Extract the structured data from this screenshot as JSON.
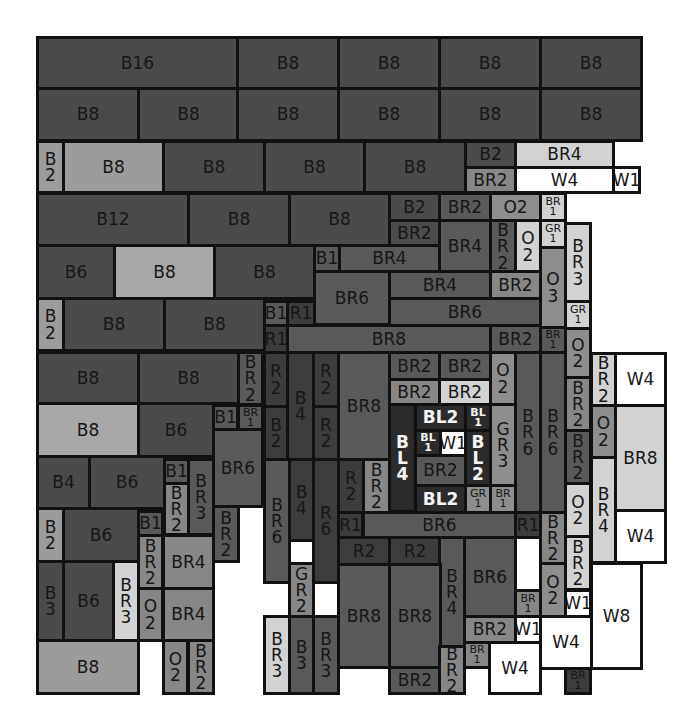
{
  "palette": {
    "B": "#4b4b4b",
    "Blight": "#9c9c9c",
    "Bpale": "#a8a8a8",
    "BR": "#5a5a5a",
    "BRmid": "#878787",
    "BRlight": "#bdbdbd",
    "BRpale": "#d2d2d2",
    "R": "#3c3c3c",
    "O": "#8e8e8e",
    "GR": "#a3a3a3",
    "W": "#ffffff",
    "BL": "#2b2b2b"
  },
  "blocks": [
    {
      "label": "B16",
      "x": 36,
      "y": 36,
      "w": 203,
      "h": 54,
      "c": "B"
    },
    {
      "label": "B8",
      "x": 236,
      "y": 36,
      "w": 104,
      "h": 54,
      "c": "B"
    },
    {
      "label": "B8",
      "x": 337,
      "y": 36,
      "w": 104,
      "h": 54,
      "c": "B"
    },
    {
      "label": "B8",
      "x": 438,
      "y": 36,
      "w": 104,
      "h": 54,
      "c": "B"
    },
    {
      "label": "B8",
      "x": 539,
      "y": 36,
      "w": 104,
      "h": 54,
      "c": "B"
    },
    {
      "label": "B8",
      "x": 36,
      "y": 87,
      "w": 104,
      "h": 55,
      "c": "B"
    },
    {
      "label": "B8",
      "x": 137,
      "y": 87,
      "w": 103,
      "h": 55,
      "c": "B"
    },
    {
      "label": "B8",
      "x": 236,
      "y": 87,
      "w": 104,
      "h": 55,
      "c": "B"
    },
    {
      "label": "B8",
      "x": 337,
      "y": 87,
      "w": 104,
      "h": 55,
      "c": "B"
    },
    {
      "label": "B8",
      "x": 438,
      "y": 87,
      "w": 104,
      "h": 55,
      "c": "B"
    },
    {
      "label": "B8",
      "x": 539,
      "y": 87,
      "w": 104,
      "h": 55,
      "c": "B"
    },
    {
      "label": "B\n2",
      "x": 36,
      "y": 140,
      "w": 29,
      "h": 54,
      "c": "Blight",
      "v": true
    },
    {
      "label": "B8",
      "x": 62,
      "y": 140,
      "w": 103,
      "h": 54,
      "c": "Blight"
    },
    {
      "label": "B8",
      "x": 162,
      "y": 140,
      "w": 104,
      "h": 54,
      "c": "B"
    },
    {
      "label": "B8",
      "x": 263,
      "y": 140,
      "w": 103,
      "h": 54,
      "c": "B"
    },
    {
      "label": "B8",
      "x": 363,
      "y": 140,
      "w": 104,
      "h": 54,
      "c": "B"
    },
    {
      "label": "B2",
      "x": 464,
      "y": 140,
      "w": 53,
      "h": 29,
      "c": "B"
    },
    {
      "label": "BR4",
      "x": 514,
      "y": 140,
      "w": 101,
      "h": 29,
      "c": "BRpale"
    },
    {
      "label": "BR2",
      "x": 464,
      "y": 166,
      "w": 53,
      "h": 28,
      "c": "BRmid"
    },
    {
      "label": "W4",
      "x": 514,
      "y": 166,
      "w": 101,
      "h": 28,
      "c": "W"
    },
    {
      "label": "W1",
      "x": 612,
      "y": 166,
      "w": 29,
      "h": 28,
      "c": "W"
    },
    {
      "label": "B12",
      "x": 36,
      "y": 192,
      "w": 154,
      "h": 55,
      "c": "B"
    },
    {
      "label": "B8",
      "x": 187,
      "y": 192,
      "w": 104,
      "h": 55,
      "c": "B"
    },
    {
      "label": "B8",
      "x": 288,
      "y": 192,
      "w": 103,
      "h": 55,
      "c": "B"
    },
    {
      "label": "B2",
      "x": 388,
      "y": 192,
      "w": 53,
      "h": 30,
      "c": "B"
    },
    {
      "label": "BR2",
      "x": 438,
      "y": 192,
      "w": 54,
      "h": 30,
      "c": "BR"
    },
    {
      "label": "O2",
      "x": 489,
      "y": 192,
      "w": 53,
      "h": 30,
      "c": "O"
    },
    {
      "label": "BR\n1",
      "x": 539,
      "y": 192,
      "w": 28,
      "h": 30,
      "c": "BRpale",
      "s": true
    },
    {
      "label": "BR2",
      "x": 388,
      "y": 219,
      "w": 53,
      "h": 28,
      "c": "B"
    },
    {
      "label": "BR4",
      "x": 438,
      "y": 219,
      "w": 54,
      "h": 55,
      "c": "BR"
    },
    {
      "label": "B\nR\n2",
      "x": 489,
      "y": 219,
      "w": 28,
      "h": 55,
      "c": "BR",
      "v": true
    },
    {
      "label": "O\n2",
      "x": 514,
      "y": 219,
      "w": 28,
      "h": 55,
      "c": "BRpale",
      "v": true
    },
    {
      "label": "GR\n1",
      "x": 539,
      "y": 219,
      "w": 28,
      "h": 30,
      "c": "BRpale",
      "s": true
    },
    {
      "label": "B\nR\n3",
      "x": 564,
      "y": 222,
      "w": 28,
      "h": 81,
      "c": "BRpale",
      "v": true
    },
    {
      "label": "B6",
      "x": 36,
      "y": 244,
      "w": 80,
      "h": 56,
      "c": "B"
    },
    {
      "label": "B8",
      "x": 113,
      "y": 244,
      "w": 103,
      "h": 56,
      "c": "Bpale"
    },
    {
      "label": "B8",
      "x": 213,
      "y": 244,
      "w": 103,
      "h": 56,
      "c": "B"
    },
    {
      "label": "B1",
      "x": 313,
      "y": 244,
      "w": 28,
      "h": 29,
      "c": "BR"
    },
    {
      "label": "BR4",
      "x": 338,
      "y": 244,
      "w": 103,
      "h": 29,
      "c": "BR"
    },
    {
      "label": "BR6",
      "x": 313,
      "y": 270,
      "w": 78,
      "h": 56,
      "c": "BR"
    },
    {
      "label": "BR4",
      "x": 388,
      "y": 270,
      "w": 104,
      "h": 30,
      "c": "BR"
    },
    {
      "label": "BR2",
      "x": 489,
      "y": 270,
      "w": 53,
      "h": 30,
      "c": "BRmid"
    },
    {
      "label": "O\n3",
      "x": 539,
      "y": 246,
      "w": 28,
      "h": 83,
      "c": "O",
      "v": true
    },
    {
      "label": "GR\n1",
      "x": 564,
      "y": 300,
      "w": 28,
      "h": 30,
      "c": "BRpale",
      "s": true
    },
    {
      "label": "B\n2",
      "x": 36,
      "y": 297,
      "w": 29,
      "h": 55,
      "c": "Blight",
      "v": true
    },
    {
      "label": "B8",
      "x": 62,
      "y": 297,
      "w": 104,
      "h": 55,
      "c": "B"
    },
    {
      "label": "B8",
      "x": 163,
      "y": 297,
      "w": 103,
      "h": 55,
      "c": "B"
    },
    {
      "label": "B1",
      "x": 263,
      "y": 300,
      "w": 26,
      "h": 27,
      "c": "BR"
    },
    {
      "label": "R1",
      "x": 286,
      "y": 300,
      "w": 30,
      "h": 27,
      "c": "R"
    },
    {
      "label": "BR6",
      "x": 388,
      "y": 297,
      "w": 154,
      "h": 30,
      "c": "BR"
    },
    {
      "label": "R1",
      "x": 263,
      "y": 324,
      "w": 26,
      "h": 30,
      "c": "R"
    },
    {
      "label": "BR8",
      "x": 286,
      "y": 324,
      "w": 206,
      "h": 30,
      "c": "BR"
    },
    {
      "label": "BR2",
      "x": 489,
      "y": 324,
      "w": 53,
      "h": 30,
      "c": "BR"
    },
    {
      "label": "BR\n1",
      "x": 539,
      "y": 326,
      "w": 28,
      "h": 28,
      "c": "BR",
      "s": true
    },
    {
      "label": "O\n2",
      "x": 564,
      "y": 327,
      "w": 28,
      "h": 52,
      "c": "O",
      "v": true
    },
    {
      "label": "B8",
      "x": 36,
      "y": 351,
      "w": 104,
      "h": 54,
      "c": "B"
    },
    {
      "label": "B8",
      "x": 137,
      "y": 351,
      "w": 103,
      "h": 54,
      "c": "B"
    },
    {
      "label": "B\nR\n2",
      "x": 237,
      "y": 351,
      "w": 27,
      "h": 55,
      "c": "BR",
      "v": true
    },
    {
      "label": "R\n2",
      "x": 263,
      "y": 351,
      "w": 26,
      "h": 57,
      "c": "R",
      "v": true
    },
    {
      "label": "B\n4",
      "x": 286,
      "y": 351,
      "w": 29,
      "h": 110,
      "c": "R",
      "v": true
    },
    {
      "label": "R\n2",
      "x": 312,
      "y": 351,
      "w": 28,
      "h": 57,
      "c": "R",
      "v": true
    },
    {
      "label": "BR8",
      "x": 337,
      "y": 351,
      "w": 54,
      "h": 110,
      "c": "BR"
    },
    {
      "label": "BR2",
      "x": 388,
      "y": 351,
      "w": 53,
      "h": 30,
      "c": "BR"
    },
    {
      "label": "BR2",
      "x": 438,
      "y": 351,
      "w": 54,
      "h": 30,
      "c": "BR"
    },
    {
      "label": "O\n2",
      "x": 489,
      "y": 351,
      "w": 28,
      "h": 55,
      "c": "O",
      "v": true
    },
    {
      "label": "BR2",
      "x": 388,
      "y": 378,
      "w": 53,
      "h": 28,
      "c": "BRmid"
    },
    {
      "label": "BR2",
      "x": 438,
      "y": 378,
      "w": 54,
      "h": 28,
      "c": "BRpale"
    },
    {
      "label": "B8",
      "x": 36,
      "y": 402,
      "w": 104,
      "h": 56,
      "c": "Bpale"
    },
    {
      "label": "B6",
      "x": 137,
      "y": 402,
      "w": 78,
      "h": 56,
      "c": "B"
    },
    {
      "label": "B1",
      "x": 212,
      "y": 404,
      "w": 27,
      "h": 27,
      "c": "BR"
    },
    {
      "label": "BR\n1",
      "x": 237,
      "y": 404,
      "w": 27,
      "h": 27,
      "c": "BR",
      "s": true
    },
    {
      "label": "B\n2",
      "x": 263,
      "y": 405,
      "w": 26,
      "h": 56,
      "c": "R",
      "v": true
    },
    {
      "label": "R\n2",
      "x": 312,
      "y": 405,
      "w": 28,
      "h": 56,
      "c": "R",
      "v": true
    },
    {
      "label": "B\nL\n4",
      "x": 388,
      "y": 403,
      "w": 29,
      "h": 110,
      "c": "BL",
      "v": true,
      "inv": true
    },
    {
      "label": "BL2",
      "x": 414,
      "y": 403,
      "w": 53,
      "h": 29,
      "c": "BL",
      "inv": true
    },
    {
      "label": "BL\n1",
      "x": 464,
      "y": 403,
      "w": 28,
      "h": 29,
      "c": "BL",
      "s": true,
      "inv": true
    },
    {
      "label": "BL\n1",
      "x": 414,
      "y": 429,
      "w": 28,
      "h": 28,
      "c": "BL",
      "s": true,
      "inv": true
    },
    {
      "label": "W1",
      "x": 439,
      "y": 429,
      "w": 28,
      "h": 28,
      "c": "W"
    },
    {
      "label": "B\nL\n2",
      "x": 464,
      "y": 429,
      "w": 28,
      "h": 58,
      "c": "BL",
      "v": true,
      "inv": true
    },
    {
      "label": "BR2",
      "x": 414,
      "y": 454,
      "w": 53,
      "h": 33,
      "c": "BR"
    },
    {
      "label": "BL2",
      "x": 414,
      "y": 484,
      "w": 53,
      "h": 30,
      "c": "BL",
      "inv": true
    },
    {
      "label": "G\nR\n3",
      "x": 489,
      "y": 403,
      "w": 28,
      "h": 84,
      "c": "O",
      "v": true
    },
    {
      "label": "GR\n1",
      "x": 464,
      "y": 484,
      "w": 28,
      "h": 30,
      "c": "O",
      "s": true
    },
    {
      "label": "BR\n1",
      "x": 489,
      "y": 484,
      "w": 28,
      "h": 30,
      "c": "O",
      "s": true
    },
    {
      "label": "B\nR\n6",
      "x": 514,
      "y": 351,
      "w": 28,
      "h": 163,
      "c": "BR",
      "v": true
    },
    {
      "label": "B\nR\n6",
      "x": 539,
      "y": 351,
      "w": 28,
      "h": 163,
      "c": "BR",
      "v": true
    },
    {
      "label": "B\nR\n2",
      "x": 590,
      "y": 352,
      "w": 27,
      "h": 55,
      "c": "BRpale",
      "v": true
    },
    {
      "label": "W4",
      "x": 614,
      "y": 352,
      "w": 53,
      "h": 55,
      "c": "W"
    },
    {
      "label": "B\nR\n2",
      "x": 564,
      "y": 376,
      "w": 28,
      "h": 56,
      "c": "BRmid",
      "v": true
    },
    {
      "label": "O\n2",
      "x": 590,
      "y": 404,
      "w": 27,
      "h": 55,
      "c": "O",
      "v": true
    },
    {
      "label": "BR8",
      "x": 614,
      "y": 404,
      "w": 53,
      "h": 108,
      "c": "BRpale"
    },
    {
      "label": "B\nR\n2",
      "x": 564,
      "y": 429,
      "w": 28,
      "h": 56,
      "c": "BR",
      "v": true
    },
    {
      "label": "B\nR\n4",
      "x": 590,
      "y": 456,
      "w": 27,
      "h": 108,
      "c": "BRpale",
      "v": true
    },
    {
      "label": "O\n2",
      "x": 564,
      "y": 482,
      "w": 28,
      "h": 56,
      "c": "BRpale",
      "v": true
    },
    {
      "label": "W4",
      "x": 614,
      "y": 509,
      "w": 53,
      "h": 55,
      "c": "W"
    },
    {
      "label": "B4",
      "x": 36,
      "y": 455,
      "w": 55,
      "h": 55,
      "c": "B"
    },
    {
      "label": "B6",
      "x": 88,
      "y": 455,
      "w": 78,
      "h": 55,
      "c": "B"
    },
    {
      "label": "B1",
      "x": 163,
      "y": 458,
      "w": 27,
      "h": 27,
      "c": "BR"
    },
    {
      "label": "B\nR\n2",
      "x": 163,
      "y": 482,
      "w": 27,
      "h": 54,
      "c": "BRmid",
      "v": true
    },
    {
      "label": "B\nR\n3",
      "x": 187,
      "y": 458,
      "w": 28,
      "h": 78,
      "c": "BR",
      "v": true
    },
    {
      "label": "BR6",
      "x": 212,
      "y": 428,
      "w": 52,
      "h": 80,
      "c": "BR"
    },
    {
      "label": "B\nR\n6",
      "x": 263,
      "y": 458,
      "w": 28,
      "h": 126,
      "c": "BR",
      "v": true
    },
    {
      "label": "B\n4",
      "x": 288,
      "y": 458,
      "w": 27,
      "h": 84,
      "c": "R",
      "v": true
    },
    {
      "label": "R\n6",
      "x": 312,
      "y": 458,
      "w": 28,
      "h": 126,
      "c": "R",
      "v": true
    },
    {
      "label": "R\n2",
      "x": 337,
      "y": 458,
      "w": 28,
      "h": 56,
      "c": "R",
      "v": true
    },
    {
      "label": "B\nR\n2",
      "x": 362,
      "y": 458,
      "w": 29,
      "h": 56,
      "c": "BRmid",
      "v": true
    },
    {
      "label": "B\n2",
      "x": 36,
      "y": 507,
      "w": 29,
      "h": 56,
      "c": "Blight",
      "v": true
    },
    {
      "label": "B6",
      "x": 62,
      "y": 507,
      "w": 78,
      "h": 56,
      "c": "B"
    },
    {
      "label": "B1",
      "x": 137,
      "y": 510,
      "w": 27,
      "h": 27,
      "c": "BR"
    },
    {
      "label": "B\nR\n2",
      "x": 212,
      "y": 505,
      "w": 28,
      "h": 58,
      "c": "BR",
      "v": true
    },
    {
      "label": "R1",
      "x": 337,
      "y": 511,
      "w": 27,
      "h": 28,
      "c": "R"
    },
    {
      "label": "BR6",
      "x": 362,
      "y": 511,
      "w": 155,
      "h": 28,
      "c": "BR"
    },
    {
      "label": "R1",
      "x": 514,
      "y": 511,
      "w": 28,
      "h": 28,
      "c": "R"
    },
    {
      "label": "B\nR\n2",
      "x": 539,
      "y": 511,
      "w": 28,
      "h": 54,
      "c": "BRmid",
      "v": true
    },
    {
      "label": "B\nR\n2",
      "x": 564,
      "y": 535,
      "w": 28,
      "h": 56,
      "c": "BRpale",
      "v": true
    },
    {
      "label": "B\nR\n2",
      "x": 137,
      "y": 534,
      "w": 27,
      "h": 56,
      "c": "BRmid",
      "v": true
    },
    {
      "label": "BR4",
      "x": 162,
      "y": 534,
      "w": 53,
      "h": 56,
      "c": "BRmid"
    },
    {
      "label": "R2",
      "x": 337,
      "y": 536,
      "w": 54,
      "h": 30,
      "c": "R"
    },
    {
      "label": "R2",
      "x": 388,
      "y": 536,
      "w": 54,
      "h": 30,
      "c": "R"
    },
    {
      "label": "B\nR\n4",
      "x": 438,
      "y": 536,
      "w": 28,
      "h": 112,
      "c": "BR",
      "v": true
    },
    {
      "label": "BR6",
      "x": 463,
      "y": 536,
      "w": 54,
      "h": 82,
      "c": "BR"
    },
    {
      "label": "BR\n1",
      "x": 514,
      "y": 589,
      "w": 28,
      "h": 29,
      "c": "BRmid",
      "s": true
    },
    {
      "label": "O\n2",
      "x": 539,
      "y": 562,
      "w": 28,
      "h": 56,
      "c": "O",
      "v": true
    },
    {
      "label": "W1",
      "x": 564,
      "y": 589,
      "w": 28,
      "h": 29,
      "c": "W"
    },
    {
      "label": "W8",
      "x": 590,
      "y": 562,
      "w": 53,
      "h": 108,
      "c": "W"
    },
    {
      "label": "B\n3",
      "x": 36,
      "y": 560,
      "w": 29,
      "h": 82,
      "c": "B",
      "v": true
    },
    {
      "label": "B6",
      "x": 62,
      "y": 560,
      "w": 53,
      "h": 82,
      "c": "B"
    },
    {
      "label": "B\nR\n3",
      "x": 112,
      "y": 560,
      "w": 28,
      "h": 82,
      "c": "BRpale",
      "v": true
    },
    {
      "label": "O\n2",
      "x": 137,
      "y": 587,
      "w": 27,
      "h": 55,
      "c": "BRmid",
      "v": true
    },
    {
      "label": "BR4",
      "x": 162,
      "y": 587,
      "w": 53,
      "h": 55,
      "c": "BRmid"
    },
    {
      "label": "G\nR\n2",
      "x": 288,
      "y": 562,
      "w": 27,
      "h": 56,
      "c": "BRmid",
      "v": true
    },
    {
      "label": "BR8",
      "x": 337,
      "y": 563,
      "w": 54,
      "h": 106,
      "c": "BR"
    },
    {
      "label": "BR8",
      "x": 388,
      "y": 563,
      "w": 54,
      "h": 106,
      "c": "BR"
    },
    {
      "label": "BR2",
      "x": 463,
      "y": 615,
      "w": 54,
      "h": 29,
      "c": "BRmid"
    },
    {
      "label": "W1",
      "x": 514,
      "y": 615,
      "w": 28,
      "h": 29,
      "c": "W"
    },
    {
      "label": "W4",
      "x": 539,
      "y": 615,
      "w": 54,
      "h": 55,
      "c": "W"
    },
    {
      "label": "B8",
      "x": 36,
      "y": 639,
      "w": 104,
      "h": 56,
      "c": "Blight"
    },
    {
      "label": "O\n2",
      "x": 162,
      "y": 639,
      "w": 27,
      "h": 56,
      "c": "BRmid",
      "v": true
    },
    {
      "label": "B\nR\n2",
      "x": 187,
      "y": 639,
      "w": 28,
      "h": 56,
      "c": "BRmid",
      "v": true
    },
    {
      "label": "B\nR\n3",
      "x": 263,
      "y": 615,
      "w": 28,
      "h": 80,
      "c": "BRpale",
      "v": true
    },
    {
      "label": "B\n3",
      "x": 288,
      "y": 615,
      "w": 27,
      "h": 80,
      "c": "BR",
      "v": true
    },
    {
      "label": "B\nR\n3",
      "x": 312,
      "y": 615,
      "w": 28,
      "h": 80,
      "c": "BR",
      "v": true
    },
    {
      "label": "BR2",
      "x": 388,
      "y": 666,
      "w": 54,
      "h": 29,
      "c": "BR"
    },
    {
      "label": "B\nR\n2",
      "x": 438,
      "y": 645,
      "w": 28,
      "h": 50,
      "c": "BRmid",
      "v": true
    },
    {
      "label": "BR\n1",
      "x": 463,
      "y": 641,
      "w": 28,
      "h": 28,
      "c": "BRmid",
      "s": true
    },
    {
      "label": "W4",
      "x": 488,
      "y": 641,
      "w": 54,
      "h": 54,
      "c": "W"
    },
    {
      "label": "BR\n1",
      "x": 564,
      "y": 667,
      "w": 28,
      "h": 28,
      "c": "R",
      "s": true
    }
  ]
}
